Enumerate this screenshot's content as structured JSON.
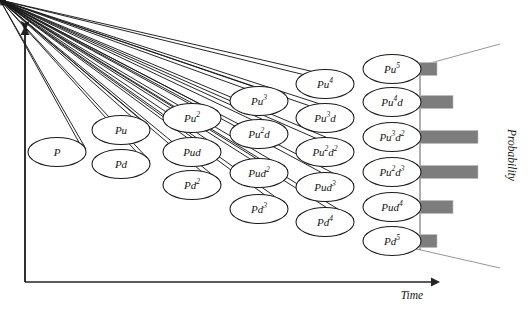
{
  "figure": {
    "type": "binomial-tree-diagram",
    "background_color": "#ffffff",
    "node_stroke_color": "#1a1a1a",
    "bar_color": "#7d7d7d",
    "axis_color": "#232323"
  },
  "axes": {
    "x_label": "Time",
    "y_label": "Probability",
    "x_axis": {
      "x1": 25,
      "y1": 282,
      "x2": 440,
      "y2": 282
    },
    "y_axis": {
      "x1": 25,
      "y1": 282,
      "x2": 25,
      "y2": 26
    }
  },
  "tree": {
    "columns": [
      {
        "index": 0,
        "cx": 57,
        "nodes": [
          {
            "label": "P",
            "sup": "",
            "cy": 152
          }
        ]
      },
      {
        "index": 1,
        "cx": 121,
        "nodes": [
          {
            "label": "Pu",
            "sup": "",
            "cy": 130
          },
          {
            "label": "Pd",
            "sup": "",
            "cy": 164
          }
        ]
      },
      {
        "index": 2,
        "cx": 192,
        "nodes": [
          {
            "label": "Pu",
            "sup": "2",
            "cy": 118
          },
          {
            "label": "Pud",
            "sup": "",
            "cy": 152
          },
          {
            "label": "Pd",
            "sup": "2",
            "cy": 185
          }
        ]
      },
      {
        "index": 3,
        "cx": 259,
        "nodes": [
          {
            "label": "Pu",
            "sup": "3",
            "cy": 101
          },
          {
            "label": "Pu",
            "sup": "2",
            "sup_tail": "d",
            "cy": 134
          },
          {
            "label": "Pud",
            "sup": "2",
            "cy": 173
          },
          {
            "label": "Pd",
            "sup": "3",
            "cy": 209
          }
        ]
      },
      {
        "index": 4,
        "cx": 325,
        "nodes": [
          {
            "label": "Pu",
            "sup": "4",
            "cy": 84
          },
          {
            "label": "Pu",
            "sup": "3",
            "sup_tail": "d",
            "cy": 118
          },
          {
            "label": "Pu",
            "sup": "2",
            "sup_tail": "d",
            "sup2": "2",
            "cy": 152
          },
          {
            "label": "Pud",
            "sup": "3",
            "cy": 187
          },
          {
            "label": "Pd",
            "sup": "4",
            "cy": 222
          }
        ]
      },
      {
        "index": 5,
        "cx": 392,
        "nodes": [
          {
            "label": "Pu",
            "sup": "5",
            "cy": 69
          },
          {
            "label": "Pu",
            "sup": "4",
            "sup_tail": "d",
            "cy": 102
          },
          {
            "label": "Pu",
            "sup": "3",
            "sup_tail": "d",
            "sup2": "2",
            "cy": 137
          },
          {
            "label": "Pu",
            "sup": "2",
            "sup_tail": "d",
            "sup2": "3",
            "cy": 172
          },
          {
            "label": "Pud",
            "sup": "4",
            "cy": 207
          },
          {
            "label": "Pd",
            "sup": "5",
            "cy": 241
          }
        ]
      }
    ],
    "node_rx": 29,
    "node_ry": 14.5
  },
  "chart_data": {
    "type": "bar",
    "title": "",
    "xlabel": "Probability",
    "ylabel": "",
    "orientation": "horizontal",
    "categories": [
      "Pu5",
      "Pu4d",
      "Pu3d2",
      "Pu2d3",
      "Pud4",
      "Pd5"
    ],
    "category_labels": [
      "Pu⁵",
      "Pu⁴d",
      "Pu³d²",
      "Pu²d³",
      "Pud⁴",
      "Pd⁵"
    ],
    "values": [
      0.28,
      0.57,
      1.0,
      1.0,
      0.57,
      0.28
    ],
    "xlim": [
      0,
      1.0
    ],
    "bar_color": "#7d7d7d",
    "grid": false,
    "legend": false,
    "note": "Binomial terminal probability distribution; bar lengths read from pixels relative to longest bar"
  },
  "bars": {
    "baseline_x": 420,
    "max_length": 58,
    "bar_height": 13,
    "items": [
      {
        "category": "Pu5",
        "cy": 69,
        "length": 17
      },
      {
        "category": "Pu4d",
        "cy": 102,
        "length": 33
      },
      {
        "category": "Pu3d2",
        "cy": 137,
        "length": 58
      },
      {
        "category": "Pu2d3",
        "cy": 172,
        "length": 58
      },
      {
        "category": "Pud4",
        "cy": 207,
        "length": 33
      },
      {
        "category": "Pd5",
        "cy": 241,
        "length": 17
      }
    ]
  },
  "fan_lines": [
    {
      "x1": 412,
      "y1": 68,
      "x2": 500,
      "y2": 44
    },
    {
      "x1": 412,
      "y1": 248,
      "x2": 500,
      "y2": 268
    }
  ]
}
